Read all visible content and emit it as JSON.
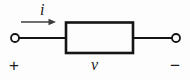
{
  "figure": {
    "kind": "circuit-diagram",
    "background_color": "#fdfdfd",
    "ink_color": "#1a1a1a",
    "arrow_color": "#4a4a4a"
  },
  "labels": {
    "current": "i",
    "voltage": "v",
    "terminal_positive": "+",
    "terminal_negative": "−"
  },
  "geometry": {
    "canvas": {
      "width": 190,
      "height": 80
    },
    "box": {
      "x": 66,
      "y": 22,
      "width": 67,
      "height": 31,
      "stroke_width": 2.6
    },
    "wire_y": 38,
    "left_terminal": {
      "cx": 15,
      "cy": 38,
      "r": 4
    },
    "right_terminal": {
      "cx": 176,
      "cy": 38,
      "r": 4
    },
    "left_wire": {
      "x1": 19,
      "x2": 66
    },
    "right_wire": {
      "x1": 133,
      "x2": 172
    },
    "current_arrow": {
      "x1": 21,
      "x2": 56,
      "y": 22,
      "head_length": 7,
      "head_half_width": 3.2
    }
  }
}
